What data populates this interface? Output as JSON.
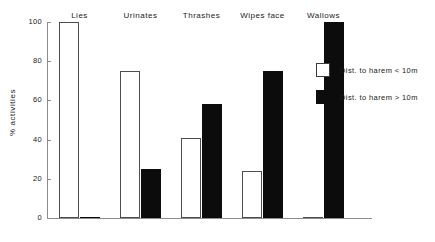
{
  "chart_data": {
    "type": "bar",
    "title": "",
    "xlabel": "",
    "ylabel": "% activities",
    "ylim": [
      0,
      100
    ],
    "yticks": [
      0,
      20,
      40,
      60,
      80,
      100
    ],
    "grid": false,
    "legend_position": "right",
    "categories": [
      "Lies",
      "Urinates",
      "Thrashes",
      "Wipes face",
      "Wallows"
    ],
    "series": [
      {
        "name": "Dist. to harem < 10m",
        "color": "#ffffff",
        "edge_color": "#4d4d4d",
        "values": [
          100,
          75,
          41,
          24,
          0
        ]
      },
      {
        "name": "Dist. to harem > 10m",
        "color": "#0c0c0c",
        "edge_color": "#0c0c0c",
        "values": [
          0,
          25,
          58,
          75,
          100
        ]
      }
    ]
  },
  "axis": {
    "tick_labels": [
      "0",
      "20",
      "40",
      "60",
      "80",
      "100"
    ],
    "line_color": "#8c8c8c"
  },
  "legend": {
    "entries": [
      {
        "label": "Dist. to harem < 10m",
        "swatch": "open-square-swatch"
      },
      {
        "label": "Dist. to harem > 10m",
        "swatch": "filled-square-swatch"
      }
    ]
  }
}
